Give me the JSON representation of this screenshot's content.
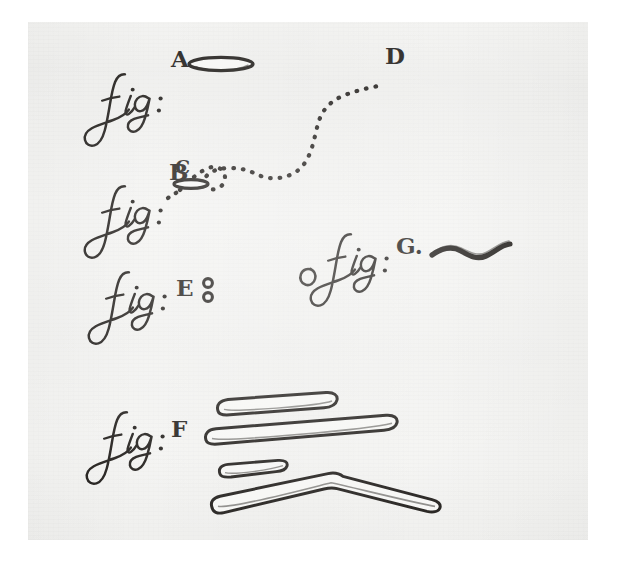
{
  "plate": {
    "title": "Figures A through G",
    "description": "Antique engraved plate of microscopic animalcules with script figure labels",
    "ink_color": "#181512",
    "paper_color": "#f3f3f1",
    "page_color": "#ffffff"
  },
  "figures": [
    {
      "id": "A",
      "label_prefix": "fig:",
      "label_letter": "A",
      "shape": "long-slender-ellipse",
      "description": "Elongated hollow ellipse, horizontal"
    },
    {
      "id": "B",
      "label_prefix": "fig:",
      "label_letter": "B",
      "shape": "small-ellipse-with-trail",
      "description": "Small hollow ellipse marked C with dotted motion trail to D"
    },
    {
      "id": "C",
      "label_prefix": "",
      "label_letter": "C",
      "shape": "trail-start-marker",
      "description": "Start point of dotted motion path, above small ellipse"
    },
    {
      "id": "D",
      "label_prefix": "",
      "label_letter": "D",
      "shape": "trail-end-marker",
      "description": "End point of dotted motion path, upper right"
    },
    {
      "id": "E",
      "label_prefix": "fig:",
      "label_letter": "E",
      "shape": "two-small-rings",
      "description": "Two minute hollow circles stacked vertically"
    },
    {
      "id": "F",
      "label_prefix": "fig:",
      "label_letter": "F",
      "shape": "four-rods",
      "description": "Four elongated rod shapes, the lowest one bent at an angle"
    },
    {
      "id": "G",
      "label_prefix": "fig:",
      "label_letter": "G.",
      "shape": "sinuous-filament",
      "description": "Wavy serpentine filament"
    }
  ],
  "labels": {
    "fig_prefix": "fig:",
    "letter_a": "A",
    "letter_b": "B",
    "letter_c": "C",
    "letter_d": "D",
    "letter_e": "E",
    "letter_f": "F",
    "letter_g": "G."
  }
}
